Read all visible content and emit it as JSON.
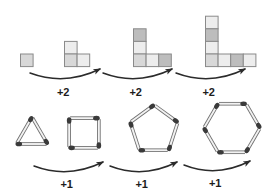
{
  "figure": {
    "background_color": "#ffffff"
  },
  "colors": {
    "tile_light": "#ededed",
    "tile_mid": "#d8d8d8",
    "tile_dark": "#bdbdbd",
    "tile_stroke": "#8a8a8a",
    "matchstick_body": "#f2f2f2",
    "matchstick_stroke": "#6e6e6e",
    "matchstick_head": "#3a3a3a",
    "arrow": "#2b2b2b",
    "label_text": "#1c1c1c"
  },
  "top_row": {
    "name": "square-tile-sequence",
    "arrow_labels": [
      "+2",
      "+2",
      "+2"
    ],
    "terms": [
      {
        "index": 1,
        "name": "tile-figure-1",
        "tile_count": 1,
        "cells": [
          {
            "col": 0,
            "row": 0,
            "shade": "tile_mid"
          }
        ]
      },
      {
        "index": 2,
        "name": "tile-figure-2",
        "tile_count": 3,
        "cells": [
          {
            "col": 0,
            "row": -1,
            "shade": "tile_light"
          },
          {
            "col": 0,
            "row": 0,
            "shade": "tile_mid"
          },
          {
            "col": 1,
            "row": 0,
            "shade": "tile_light"
          }
        ]
      },
      {
        "index": 3,
        "name": "tile-figure-3",
        "tile_count": 5,
        "cells": [
          {
            "col": 0,
            "row": -2,
            "shade": "tile_dark"
          },
          {
            "col": 0,
            "row": -1,
            "shade": "tile_light"
          },
          {
            "col": 0,
            "row": 0,
            "shade": "tile_mid"
          },
          {
            "col": 1,
            "row": 0,
            "shade": "tile_light"
          },
          {
            "col": 2,
            "row": 0,
            "shade": "tile_dark"
          }
        ]
      },
      {
        "index": 4,
        "name": "tile-figure-4",
        "tile_count": 7,
        "cells": [
          {
            "col": 0,
            "row": -3,
            "shade": "tile_light"
          },
          {
            "col": 0,
            "row": -2,
            "shade": "tile_dark"
          },
          {
            "col": 0,
            "row": -1,
            "shade": "tile_light"
          },
          {
            "col": 0,
            "row": 0,
            "shade": "tile_mid"
          },
          {
            "col": 1,
            "row": 0,
            "shade": "tile_light"
          },
          {
            "col": 2,
            "row": 0,
            "shade": "tile_dark"
          },
          {
            "col": 3,
            "row": 0,
            "shade": "tile_light"
          }
        ]
      }
    ]
  },
  "bottom_row": {
    "name": "matchstick-polygon-sequence",
    "arrow_labels": [
      "+1",
      "+1",
      "+1"
    ],
    "terms": [
      {
        "index": 1,
        "name": "polygon-triangle",
        "sides": 3,
        "radius": 18,
        "rotation": -90
      },
      {
        "index": 2,
        "name": "polygon-square",
        "sides": 4,
        "radius": 21,
        "rotation": -135
      },
      {
        "index": 3,
        "name": "polygon-pentagon",
        "sides": 5,
        "radius": 25,
        "rotation": -90
      },
      {
        "index": 4,
        "name": "polygon-hexagon",
        "sides": 6,
        "radius": 28,
        "rotation": -120
      }
    ]
  },
  "chart_data": {
    "type": "line",
    "xlabel": "Term number",
    "ylabel": "Count",
    "x": [
      1,
      2,
      3,
      4
    ],
    "series": [
      {
        "name": "Square tiles",
        "values": [
          1,
          3,
          5,
          7
        ],
        "step": 2
      },
      {
        "name": "Matchsticks / polygon sides",
        "values": [
          3,
          4,
          5,
          6
        ],
        "step": 1
      }
    ],
    "annotations": [
      "+2",
      "+2",
      "+2",
      "+1",
      "+1",
      "+1"
    ],
    "grid": false,
    "legend": "none"
  }
}
